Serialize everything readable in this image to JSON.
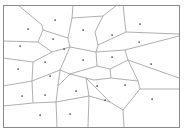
{
  "diagram": {
    "type": "voronoi",
    "width": 186,
    "height": 132,
    "frame": {
      "x1": 3,
      "y1": 5,
      "x2": 179,
      "y2": 127
    },
    "colors": {
      "edge": "#9a9a9a",
      "frame": "#8a8a8a",
      "seed": "#333333",
      "background": "#ffffff"
    },
    "seeds": [
      [
        55,
        20
      ],
      [
        28,
        29
      ],
      [
        53,
        39
      ],
      [
        20,
        46
      ],
      [
        83,
        30
      ],
      [
        64,
        49
      ],
      [
        45,
        62
      ],
      [
        83,
        60
      ],
      [
        140,
        24
      ],
      [
        112,
        35
      ],
      [
        139,
        42
      ],
      [
        112,
        57
      ],
      [
        151,
        64
      ],
      [
        18,
        69
      ],
      [
        50,
        76
      ],
      [
        76,
        91
      ],
      [
        22,
        96
      ],
      [
        45,
        95
      ],
      [
        40,
        115
      ],
      [
        70,
        114
      ],
      [
        97,
        86
      ],
      [
        125,
        85
      ],
      [
        105,
        100
      ],
      [
        152,
        99
      ]
    ],
    "edges": [
      [
        [
          18,
          5
        ],
        [
          42,
          25
        ]
      ],
      [
        [
          42,
          25
        ],
        [
          43,
          30
        ]
      ],
      [
        [
          43,
          30
        ],
        [
          68,
          38
        ]
      ],
      [
        [
          68,
          38
        ],
        [
          72,
          18
        ]
      ],
      [
        [
          72,
          18
        ],
        [
          73,
          5
        ]
      ],
      [
        [
          72,
          18
        ],
        [
          103,
          16
        ]
      ],
      [
        [
          103,
          16
        ],
        [
          117,
          5
        ]
      ],
      [
        [
          103,
          16
        ],
        [
          95,
          32
        ]
      ],
      [
        [
          95,
          32
        ],
        [
          98,
          45
        ]
      ],
      [
        [
          98,
          45
        ],
        [
          126,
          32
        ]
      ],
      [
        [
          126,
          32
        ],
        [
          123,
          5
        ]
      ],
      [
        [
          126,
          32
        ],
        [
          179,
          34
        ]
      ],
      [
        [
          98,
          45
        ],
        [
          96,
          52
        ]
      ],
      [
        [
          96,
          52
        ],
        [
          125,
          50
        ]
      ],
      [
        [
          125,
          50
        ],
        [
          179,
          36
        ]
      ],
      [
        [
          125,
          50
        ],
        [
          128,
          60
        ]
      ],
      [
        [
          128,
          60
        ],
        [
          179,
          78
        ]
      ],
      [
        [
          68,
          38
        ],
        [
          70,
          47
        ]
      ],
      [
        [
          70,
          47
        ],
        [
          96,
          52
        ]
      ],
      [
        [
          43,
          30
        ],
        [
          38,
          42
        ]
      ],
      [
        [
          38,
          42
        ],
        [
          3,
          41
        ]
      ],
      [
        [
          38,
          42
        ],
        [
          52,
          52
        ]
      ],
      [
        [
          52,
          52
        ],
        [
          70,
          47
        ]
      ],
      [
        [
          52,
          52
        ],
        [
          33,
          62
        ]
      ],
      [
        [
          33,
          62
        ],
        [
          3,
          58
        ]
      ],
      [
        [
          33,
          62
        ],
        [
          32,
          81
        ]
      ],
      [
        [
          32,
          81
        ],
        [
          3,
          86
        ]
      ],
      [
        [
          70,
          47
        ],
        [
          60,
          70
        ]
      ],
      [
        [
          60,
          70
        ],
        [
          70,
          74
        ]
      ],
      [
        [
          70,
          74
        ],
        [
          97,
          66
        ]
      ],
      [
        [
          97,
          66
        ],
        [
          96,
          52
        ]
      ],
      [
        [
          97,
          66
        ],
        [
          110,
          69
        ]
      ],
      [
        [
          110,
          69
        ],
        [
          128,
          60
        ]
      ],
      [
        [
          110,
          69
        ],
        [
          111,
          78
        ]
      ],
      [
        [
          111,
          78
        ],
        [
          138,
          81
        ]
      ],
      [
        [
          138,
          81
        ],
        [
          128,
          60
        ]
      ],
      [
        [
          138,
          81
        ],
        [
          140,
          89
        ]
      ],
      [
        [
          140,
          89
        ],
        [
          179,
          89
        ]
      ],
      [
        [
          140,
          89
        ],
        [
          123,
          110
        ]
      ],
      [
        [
          123,
          110
        ],
        [
          124,
          127
        ]
      ],
      [
        [
          123,
          110
        ],
        [
          110,
          102
        ]
      ],
      [
        [
          110,
          102
        ],
        [
          86,
          78
        ]
      ],
      [
        [
          111,
          78
        ],
        [
          94,
          80
        ]
      ],
      [
        [
          94,
          80
        ],
        [
          86,
          78
        ]
      ],
      [
        [
          86,
          78
        ],
        [
          70,
          74
        ]
      ],
      [
        [
          60,
          70
        ],
        [
          32,
          81
        ]
      ],
      [
        [
          32,
          81
        ],
        [
          33,
          103
        ]
      ],
      [
        [
          33,
          103
        ],
        [
          3,
          106
        ]
      ],
      [
        [
          33,
          103
        ],
        [
          56,
          102
        ]
      ],
      [
        [
          56,
          102
        ],
        [
          58,
          86
        ]
      ],
      [
        [
          58,
          86
        ],
        [
          70,
          74
        ]
      ],
      [
        [
          58,
          86
        ],
        [
          60,
          70
        ]
      ],
      [
        [
          56,
          102
        ],
        [
          89,
          96
        ]
      ],
      [
        [
          89,
          96
        ],
        [
          86,
          78
        ]
      ],
      [
        [
          89,
          96
        ],
        [
          88,
          127
        ]
      ],
      [
        [
          89,
          96
        ],
        [
          110,
          102
        ]
      ],
      [
        [
          56,
          102
        ],
        [
          57,
          127
        ]
      ]
    ]
  }
}
